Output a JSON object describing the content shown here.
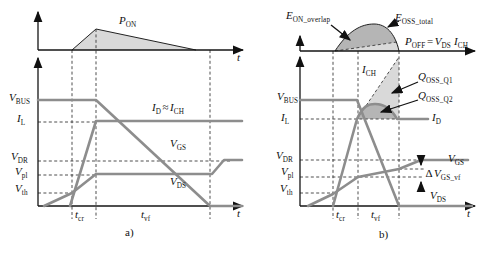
{
  "colors": {
    "c-wave": "#8d8d8d",
    "c-axis": "#151515",
    "c-light": "#d9d9d9",
    "c-dark": "#b5b5b5",
    "c-text": "#111111",
    "c-bg": "#ffffff"
  },
  "plot_a": {
    "caption": "a)",
    "pon": {
      "m": "P",
      "s": "ON"
    },
    "t_top": "t",
    "t_bottom": "t",
    "vbus": {
      "m": "V",
      "s": "BUS"
    },
    "il": {
      "m": "I",
      "s": "L"
    },
    "id_ich": {
      "m1": "I",
      "s1": "D",
      "op": "≈",
      "m2": "I",
      "s2": "CH"
    },
    "vgs": {
      "m": "V",
      "s": "GS"
    },
    "vdr": {
      "m": "V",
      "s": "DR"
    },
    "vpl": {
      "m": "V",
      "s": "pl"
    },
    "vth": {
      "m": "V",
      "s": "th"
    },
    "vds": {
      "m": "V",
      "s": "DS"
    },
    "tcr": {
      "m": "t",
      "s": "cr"
    },
    "tvf": {
      "m": "t",
      "s": "vf"
    }
  },
  "plot_b": {
    "caption": "b)",
    "eon": {
      "m": "E",
      "s": "ON_overlap"
    },
    "eoss": {
      "m": "E",
      "s": "OSS_total"
    },
    "poff": {
      "m1": "P",
      "s1": "OFF",
      "op": "=",
      "m2": "V",
      "s2": "DS",
      "m3": "I",
      "s3": "CH"
    },
    "ich": {
      "m": "I",
      "s": "CH"
    },
    "qoss1": {
      "m": "Q",
      "s": "OSS_Q1"
    },
    "qoss2": {
      "m": "Q",
      "s": "OSS_Q2"
    },
    "vbus": {
      "m": "V",
      "s": "BUS"
    },
    "il": {
      "m": "I",
      "s": "L"
    },
    "id": {
      "m": "I",
      "s": "D"
    },
    "vdr": {
      "m": "V",
      "s": "DR"
    },
    "vgs": {
      "m": "V",
      "s": "GS"
    },
    "vpl": {
      "m": "V",
      "s": "pl"
    },
    "dvgs": {
      "pre": "Δ",
      "m": "V",
      "s": "GS_vf"
    },
    "vth": {
      "m": "V",
      "s": "th"
    },
    "vds": {
      "m": "V",
      "s": "DS"
    },
    "tcr": {
      "m": "t",
      "s": "cr"
    },
    "tvf": {
      "m": "t",
      "s": "vf"
    },
    "t": "t"
  }
}
